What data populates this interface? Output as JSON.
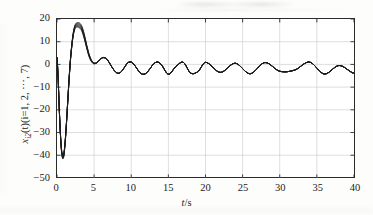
{
  "figure": {
    "background_color": "#fdfdfc",
    "axis_color": "#2b2b2b",
    "grid_color": "#cfcfcf",
    "trace_color": "#1c1c1c"
  },
  "axis_labels": {
    "x_symbol": "t",
    "x_separator": "/",
    "x_unit": "s",
    "y_var": "x",
    "y_sub": "i2",
    "y_arg": "(t)(i=1, 2, ⋯, 7)"
  },
  "chart_data": {
    "type": "line",
    "title": "",
    "xlabel": "t/s",
    "ylabel": "x_i2(t)(i=1, 2, ⋯, 7)",
    "xlim": [
      0,
      40
    ],
    "ylim": [
      -50,
      20
    ],
    "xticks": [
      0,
      5,
      10,
      15,
      20,
      25,
      30,
      35,
      40
    ],
    "yticks": [
      20,
      10,
      0,
      -10,
      -20,
      -30,
      -40,
      -50
    ],
    "xtick_labels": [
      "0",
      "5",
      "10",
      "15",
      "20",
      "25",
      "30",
      "35",
      "40"
    ],
    "ytick_labels": [
      "20",
      "10",
      "0",
      "−10",
      "−20",
      "−30",
      "−40",
      "−50"
    ],
    "grid": true,
    "legend": false,
    "n_series": 7,
    "series_note": "Seven nearly-coincident trajectories x_i2(t), i=1..7, plotted in black; they separate visibly only near the first overshoot peak.",
    "annotations": {
      "initial_value": 3,
      "undershoot_value": -41,
      "undershoot_time": 0.8,
      "overshoot_value": 17.5,
      "overshoot_time": 3.2,
      "steady_center": -1.7,
      "steady_amplitude": 2.8,
      "steady_max": 1.1,
      "steady_min": -4.5,
      "steady_period": 3.3
    },
    "series": [
      {
        "name": "x_12(t)",
        "spread": 0.0,
        "x": [
          0,
          0.15,
          0.3,
          0.45,
          0.6,
          0.75,
          0.9,
          1.05,
          1.2,
          1.4,
          1.6,
          1.8,
          2.0,
          2.2,
          2.4,
          2.6,
          2.8,
          3.0,
          3.2,
          3.4,
          3.6,
          3.8,
          4.0,
          4.3,
          4.6,
          4.9,
          5.2,
          5.5,
          5.8,
          6.2,
          6.6,
          7.0,
          7.4,
          7.8,
          8.2,
          8.6,
          9.0,
          9.5,
          10.0,
          10.5,
          11.0,
          11.5,
          12.0,
          12.5,
          13.0,
          13.5,
          14.0,
          15.0,
          16.0,
          17.0,
          18.0,
          19.0,
          20.0,
          22.0,
          24.0,
          26.0,
          28.0,
          30.0,
          32.0,
          34.0,
          36.0,
          38.0,
          40.0
        ],
        "y": [
          3.0,
          -6.0,
          -19.0,
          -30.0,
          -37.5,
          -40.8,
          -40.2,
          -36.0,
          -29.5,
          -19.0,
          -8.0,
          1.5,
          8.5,
          13.5,
          16.3,
          17.3,
          17.4,
          17.2,
          16.6,
          15.3,
          13.2,
          10.6,
          7.8,
          4.2,
          1.8,
          0.6,
          0.5,
          1.2,
          2.2,
          3.0,
          2.6,
          1.0,
          -1.2,
          -3.0,
          -3.9,
          -3.4,
          -1.7,
          0.6,
          1.0,
          -0.6,
          -2.9,
          -4.3,
          -3.9,
          -2.0,
          0.2,
          1.0,
          0.0,
          -4.3,
          -1.0,
          0.9,
          -3.8,
          -3.1,
          0.9,
          -3.5,
          0.5,
          -4.1,
          0.8,
          -3.0,
          -2.5,
          1.0,
          -4.2,
          -0.5,
          -3.9
        ]
      }
    ]
  }
}
